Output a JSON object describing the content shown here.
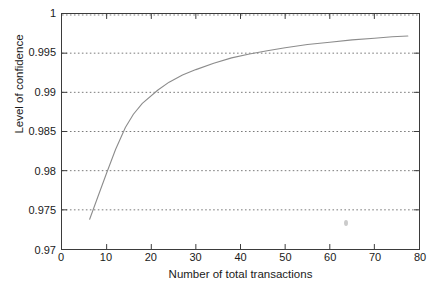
{
  "chart_data": {
    "type": "line",
    "title": "",
    "xlabel": "Number of total transactions",
    "ylabel": "Level of confidence",
    "xlim": [
      0,
      80
    ],
    "ylim": [
      0.97,
      1
    ],
    "xticks": [
      0,
      10,
      20,
      30,
      40,
      50,
      60,
      70,
      80
    ],
    "xtick_labels": [
      "0",
      "10",
      "20",
      "30",
      "40",
      "50",
      "60",
      "70",
      "80"
    ],
    "yticks": [
      0.97,
      0.975,
      0.98,
      0.985,
      0.99,
      0.995,
      1
    ],
    "ytick_labels": [
      "0.97",
      "0.975",
      "0.98",
      "0.985",
      "0.99",
      "0.995",
      "1"
    ],
    "grid": true,
    "grid_style": "dotted-horizontal",
    "legend": null,
    "series": [
      {
        "name": "Level of confidence",
        "color": "#8c8c8c",
        "x": [
          6.2,
          8.0,
          10.0,
          12.0,
          14.2,
          16.0,
          18.0,
          21.5,
          24.0,
          27.0,
          30.0,
          34.0,
          38.0,
          42.0,
          46.0,
          50.0,
          55.0,
          60.0,
          65.0,
          70.0,
          74.0,
          77.5
        ],
        "y": [
          0.9738,
          0.9766,
          0.9797,
          0.9827,
          0.9855,
          0.9872,
          0.9886,
          0.9903,
          0.9913,
          0.9922,
          0.9929,
          0.9937,
          0.9944,
          0.9949,
          0.9953,
          0.9957,
          0.9961,
          0.9964,
          0.9967,
          0.9969,
          0.9971,
          0.9972
        ]
      }
    ],
    "annotations": [
      {
        "name": "scan-speck",
        "x": 63.5,
        "y": 0.9734,
        "note": "faint gray scan artifact"
      }
    ],
    "colors": {
      "axis": "#3b3b3b",
      "grid": "#7a7a7a",
      "curve": "#8c8c8c",
      "text": "#1a1a1a",
      "background": "#ffffff"
    }
  }
}
